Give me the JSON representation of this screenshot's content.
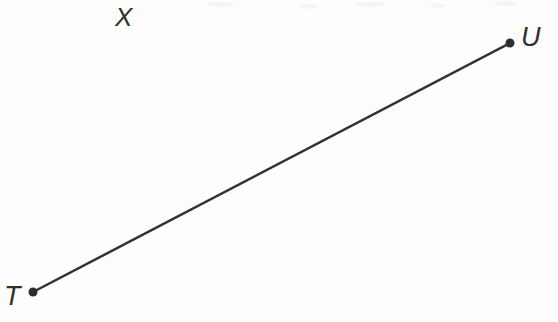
{
  "figure": {
    "kind": "line-segment-diagram",
    "width": 558,
    "height": 322,
    "background_color": "#fdfdfd",
    "stroke_color": "#333333",
    "stroke_width": 2.5,
    "point_color": "#2e2e2e",
    "point_radius": 4.5,
    "label_color": "#2f2f2f",
    "segment": {
      "name": "segment-TU",
      "from": {
        "label": "T",
        "x": 33,
        "y": 292
      },
      "to": {
        "label": "U",
        "x": 510,
        "y": 43
      }
    },
    "labels": {
      "endpoint_start": "T",
      "endpoint_end": "U",
      "line_name": "X"
    }
  }
}
